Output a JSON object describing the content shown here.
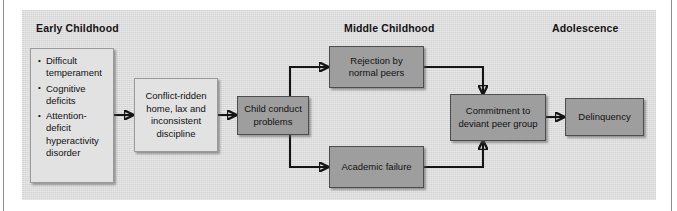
{
  "figure": {
    "background_color": "#d8d8d8",
    "page_color": "#ffffff",
    "line_color": "#151515",
    "light_box_color": "#e2e2e2",
    "dark_box_color": "#9e9e9e"
  },
  "stages": [
    {
      "id": "early-childhood",
      "label": "Early Childhood"
    },
    {
      "id": "middle-childhood",
      "label": "Middle Childhood"
    },
    {
      "id": "adolescence",
      "label": "Adolescence"
    }
  ],
  "nodes": [
    {
      "id": "child-risk-factors",
      "style": "light",
      "kind": "bullet-list",
      "items": [
        "Difficult temperament",
        "Cognitive deficits",
        "Attention-deficit hyperactivity disorder"
      ]
    },
    {
      "id": "family-context",
      "style": "light",
      "kind": "text",
      "label": "Conflict-ridden home, lax and inconsistent discipline"
    },
    {
      "id": "child-conduct-problems",
      "style": "dark",
      "kind": "text",
      "label": "Child conduct problems"
    },
    {
      "id": "peer-rejection",
      "style": "dark",
      "kind": "text",
      "label": "Rejection by normal peers"
    },
    {
      "id": "academic-failure",
      "style": "dark",
      "kind": "text",
      "label": "Academic failure"
    },
    {
      "id": "deviant-peer-group",
      "style": "dark",
      "kind": "text",
      "label": "Commitment to deviant peer group"
    },
    {
      "id": "delinquency",
      "style": "dark",
      "kind": "text",
      "label": "Delinquency"
    }
  ],
  "edges": [
    {
      "from": "child-risk-factors",
      "to": "family-context",
      "shape": "straight"
    },
    {
      "from": "family-context",
      "to": "child-conduct-problems",
      "shape": "straight"
    },
    {
      "from": "child-conduct-problems",
      "to": "peer-rejection",
      "shape": "elbow-up"
    },
    {
      "from": "child-conduct-problems",
      "to": "academic-failure",
      "shape": "elbow-down"
    },
    {
      "from": "peer-rejection",
      "to": "deviant-peer-group",
      "shape": "elbow-down"
    },
    {
      "from": "academic-failure",
      "to": "deviant-peer-group",
      "shape": "elbow-up"
    },
    {
      "from": "deviant-peer-group",
      "to": "delinquency",
      "shape": "straight"
    }
  ]
}
